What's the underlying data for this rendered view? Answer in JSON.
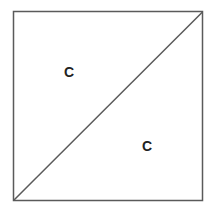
{
  "diagram": {
    "shape": "square divided by diagonal",
    "stroke_color": "#5a5a5a",
    "regions": [
      {
        "label": "C",
        "position": "upper-left triangle"
      },
      {
        "label": "C",
        "position": "lower-right triangle"
      }
    ]
  }
}
